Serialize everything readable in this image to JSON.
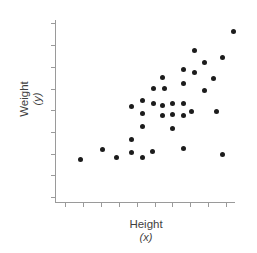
{
  "chart_data": {
    "type": "scatter",
    "title": "",
    "xlabel": "Height (x)",
    "ylabel": "Weight (y)",
    "x_axis": {
      "label": "Height",
      "sub_label": "(x)",
      "tick_count": 10,
      "tick_labels_shown": false,
      "range_tick_units": [
        0,
        9
      ]
    },
    "y_axis": {
      "label": "Weight",
      "sub_label": "(y)",
      "tick_count": 9,
      "tick_labels_shown": false,
      "range_tick_units": [
        0,
        8
      ]
    },
    "grid": false,
    "legend_shown": false,
    "marker": {
      "shape": "circle",
      "diameter_px": 5
    },
    "colors": {
      "marker": "#1c1c1c",
      "axis": "#9a9a9a",
      "text": "#3f3f3f",
      "background": "#ffffff"
    },
    "points_tick_units": [
      [
        9.39,
        7.65
      ],
      [
        7.21,
        6.77
      ],
      [
        8.77,
        6.41
      ],
      [
        7.77,
        6.22
      ],
      [
        6.59,
        5.9
      ],
      [
        7.21,
        5.76
      ],
      [
        5.47,
        5.53
      ],
      [
        8.32,
        5.48
      ],
      [
        6.59,
        5.21
      ],
      [
        4.92,
        5.02
      ],
      [
        5.53,
        4.98
      ],
      [
        7.77,
        4.93
      ],
      [
        4.3,
        4.47
      ],
      [
        4.92,
        4.33
      ],
      [
        5.47,
        4.24
      ],
      [
        6.03,
        4.33
      ],
      [
        6.59,
        4.33
      ],
      [
        3.69,
        4.19
      ],
      [
        4.3,
        3.87
      ],
      [
        5.47,
        3.78
      ],
      [
        6.03,
        3.82
      ],
      [
        6.59,
        3.78
      ],
      [
        7.09,
        3.96
      ],
      [
        8.44,
        3.96
      ],
      [
        4.3,
        3.27
      ],
      [
        6.03,
        3.18
      ],
      [
        2.12,
        2.21
      ],
      [
        3.69,
        2.63
      ],
      [
        2.85,
        1.8
      ],
      [
        3.69,
        2.03
      ],
      [
        4.3,
        1.84
      ],
      [
        4.86,
        2.12
      ],
      [
        6.59,
        2.26
      ],
      [
        8.77,
        1.98
      ],
      [
        0.89,
        1.71
      ]
    ]
  }
}
